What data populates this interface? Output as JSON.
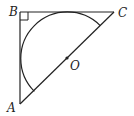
{
  "figure": {
    "type": "geometry",
    "points": {
      "A": {
        "label": "A",
        "x": 20,
        "y": 104
      },
      "B": {
        "label": "B",
        "x": 20,
        "y": 12
      },
      "C": {
        "label": "C",
        "x": 114,
        "y": 12
      },
      "O": {
        "label": "O",
        "x": 67,
        "y": 58
      }
    },
    "right_angle_at": "B",
    "stroke_color": "#222222"
  }
}
